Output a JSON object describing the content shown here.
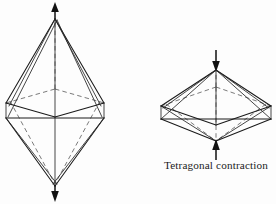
{
  "figure": {
    "background_color": "#fdfdfd",
    "line_color": "#1a1a1a",
    "hidden_line_color": "#6b6b6b",
    "caption": "Tetragonal  contraction",
    "panels": [
      {
        "id": "elongation",
        "name": "elongated-octahedron",
        "label": "",
        "distortion": "elongation",
        "arrow_direction_top": "up",
        "arrow_direction_bottom": "down",
        "geometry": {
          "center_x": 55,
          "center_y": 103,
          "apex_top_y": 18,
          "apex_bottom_y": 186,
          "equator_half_width": 49,
          "equator_depth": 15,
          "axis_top_start_y": 4,
          "axis_bottom_end_y": 200
        }
      },
      {
        "id": "contraction",
        "name": "flattened-octahedron",
        "label": "Tetragonal  contraction",
        "distortion": "contraction",
        "arrow_direction_top": "down",
        "arrow_direction_bottom": "up",
        "geometry": {
          "center_x": 216,
          "center_y": 106,
          "apex_top_y": 70,
          "apex_bottom_y": 141,
          "equator_half_width": 55,
          "equator_depth": 19,
          "axis_top_start_y": 50,
          "axis_bottom_end_y": 160
        }
      }
    ]
  }
}
